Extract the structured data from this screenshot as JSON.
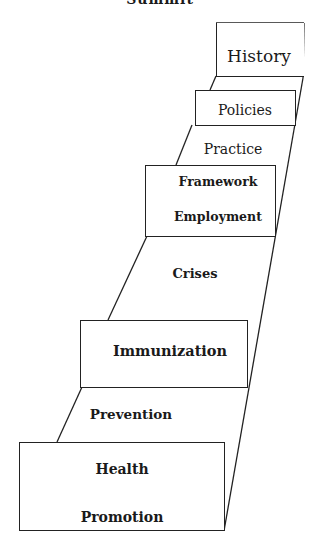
{
  "title": "Summit",
  "steps": [
    {
      "label": "History"
    },
    {
      "label": "Policies"
    },
    {
      "label": "Practice"
    },
    {
      "label": "Framework"
    },
    {
      "label": "Employment"
    },
    {
      "label": "Crises"
    },
    {
      "label": "Immunization"
    },
    {
      "label": "Prevention"
    },
    {
      "label": "Health"
    },
    {
      "label": "Promotion"
    }
  ]
}
